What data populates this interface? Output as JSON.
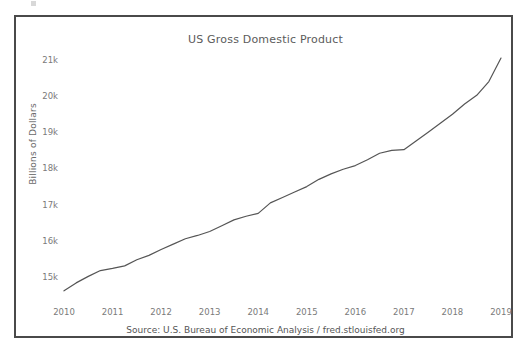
{
  "figure": {
    "source_caption": "Source: U.S. Bureau of Economic Analysis / fred.stlouisfed.org",
    "frame_color": "#4a4a4a",
    "background_color": "#ffffff"
  },
  "chart_data": {
    "type": "line",
    "title": "US Gross Domestic Product",
    "xlabel": "",
    "ylabel": "Billions of Dollars",
    "line_color": "#555555",
    "grid": false,
    "legend": null,
    "xlim": [
      2010.0,
      2019.0
    ],
    "ylim": [
      14450,
      21300
    ],
    "xticks": [
      "2010",
      "2011",
      "2012",
      "2013",
      "2014",
      "2015",
      "2016",
      "2017",
      "2018",
      "2019"
    ],
    "xtick_values": [
      2010,
      2011,
      2012,
      2013,
      2014,
      2015,
      2016,
      2017,
      2018,
      2019
    ],
    "yticks": [
      "15k",
      "16k",
      "17k",
      "18k",
      "19k",
      "20k",
      "21k"
    ],
    "ytick_values": [
      15000,
      16000,
      17000,
      18000,
      19000,
      20000,
      21000
    ],
    "x": [
      2010.0,
      2010.25,
      2010.5,
      2010.75,
      2011.0,
      2011.25,
      2011.5,
      2011.75,
      2012.0,
      2012.25,
      2012.5,
      2012.75,
      2013.0,
      2013.25,
      2013.5,
      2013.75,
      2014.0,
      2014.25,
      2014.5,
      2014.75,
      2015.0,
      2015.25,
      2015.5,
      2015.75,
      2016.0,
      2016.25,
      2016.5,
      2016.75,
      2017.0,
      2017.25,
      2017.5,
      2017.75,
      2018.0,
      2018.25,
      2018.5,
      2018.75,
      2019.0
    ],
    "values": [
      14620,
      14840,
      15020,
      15180,
      15240,
      15310,
      15480,
      15600,
      15760,
      15910,
      16060,
      16150,
      16260,
      16420,
      16580,
      16680,
      16760,
      17050,
      17200,
      17350,
      17500,
      17700,
      17850,
      17980,
      18080,
      18240,
      18420,
      18500,
      18520,
      18760,
      19000,
      19250,
      19500,
      19780,
      20020,
      20400,
      21050
    ],
    "series": [
      {
        "name": "US Gross Domestic Product",
        "values": [
          14620,
          14840,
          15020,
          15180,
          15240,
          15310,
          15480,
          15600,
          15760,
          15910,
          16060,
          16150,
          16260,
          16420,
          16580,
          16680,
          16760,
          17050,
          17200,
          17350,
          17500,
          17700,
          17850,
          17980,
          18080,
          18240,
          18420,
          18500,
          18520,
          18760,
          19000,
          19250,
          19500,
          19780,
          20020,
          20400,
          21050
        ]
      }
    ],
    "units": "Billions of Dollars",
    "annotations": []
  }
}
